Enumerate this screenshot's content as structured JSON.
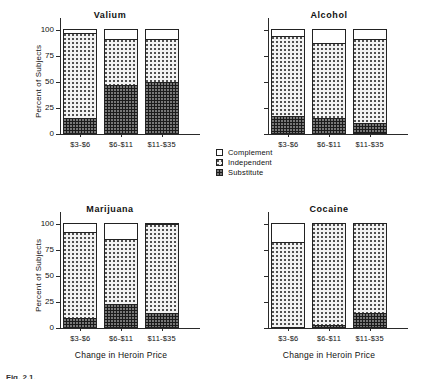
{
  "figure": {
    "caption": "Fig. 2.1.",
    "xlabel": "Change in Heroin Price",
    "ylabel": "Percent of Subjects"
  },
  "legend": {
    "position": "center-right",
    "items": [
      {
        "label": "Complement",
        "key": "complement",
        "pattern": "white",
        "color": "#ffffff"
      },
      {
        "label": "Independent",
        "key": "independent",
        "pattern": "dotted",
        "color": "#f2f2f2"
      },
      {
        "label": "Substitute",
        "key": "substitute",
        "pattern": "dark-checker",
        "color": "#1b1b1b"
      }
    ]
  },
  "chart_data": [
    {
      "type": "bar",
      "subtype": "stacked",
      "title": "Valium",
      "xlabel": "",
      "ylabel": "Percent of Subjects",
      "categories": [
        "$3-$6",
        "$6-$11",
        "$11-$35"
      ],
      "ylim": [
        0,
        100
      ],
      "yticks": [
        0,
        25,
        50,
        75,
        100
      ],
      "ytick_labels": [
        "0",
        "25",
        "50",
        "75",
        "100"
      ],
      "show_ytick_labels": true,
      "grid": false,
      "series": [
        {
          "name": "Substitute",
          "values": [
            14,
            46,
            49
          ]
        },
        {
          "name": "Independent",
          "values": [
            82,
            44,
            41
          ]
        },
        {
          "name": "Complement",
          "values": [
            4,
            10,
            10
          ]
        }
      ]
    },
    {
      "type": "bar",
      "subtype": "stacked",
      "title": "Alcohol",
      "xlabel": "",
      "ylabel": "",
      "categories": [
        "$3-$6",
        "$6-$11",
        "$11-$35"
      ],
      "ylim": [
        0,
        100
      ],
      "yticks": [
        0,
        25,
        50,
        75,
        100
      ],
      "ytick_labels": [
        "",
        "",
        "",
        "",
        ""
      ],
      "show_ytick_labels": false,
      "grid": false,
      "series": [
        {
          "name": "Substitute",
          "values": [
            16,
            14,
            10
          ]
        },
        {
          "name": "Independent",
          "values": [
            77,
            73,
            80
          ]
        },
        {
          "name": "Complement",
          "values": [
            7,
            13,
            10
          ]
        }
      ]
    },
    {
      "type": "bar",
      "subtype": "stacked",
      "title": "Marijuana",
      "xlabel": "Change in Heroin Price",
      "ylabel": "Percent of Subjects",
      "categories": [
        "$3-$6",
        "$6-$11",
        "$11-$35"
      ],
      "ylim": [
        0,
        100
      ],
      "yticks": [
        0,
        25,
        50,
        75,
        100
      ],
      "ytick_labels": [
        "0",
        "25",
        "50",
        "75",
        "100"
      ],
      "show_ytick_labels": true,
      "grid": false,
      "series": [
        {
          "name": "Substitute",
          "values": [
            9,
            22,
            13
          ]
        },
        {
          "name": "Independent",
          "values": [
            82,
            63,
            86
          ]
        },
        {
          "name": "Complement",
          "values": [
            9,
            15,
            1
          ]
        }
      ]
    },
    {
      "type": "bar",
      "subtype": "stacked",
      "title": "Cocaine",
      "xlabel": "Change in Heroin Price",
      "ylabel": "",
      "categories": [
        "$3-$6",
        "$6-$11",
        "$11-$35"
      ],
      "ylim": [
        0,
        100
      ],
      "yticks": [
        0,
        25,
        50,
        75,
        100
      ],
      "ytick_labels": [
        "",
        "",
        "",
        "",
        ""
      ],
      "show_ytick_labels": false,
      "grid": false,
      "series": [
        {
          "name": "Substitute",
          "values": [
            0,
            2,
            13
          ]
        },
        {
          "name": "Independent",
          "values": [
            82,
            98,
            87
          ]
        },
        {
          "name": "Complement",
          "values": [
            18,
            0,
            0
          ]
        }
      ]
    }
  ]
}
